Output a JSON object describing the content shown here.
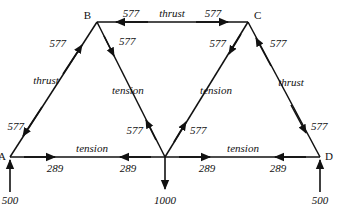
{
  "diagram": {
    "type": "truss-force-diagram",
    "title": "",
    "stroke_color": "#111111",
    "background_color": "#ffffff",
    "nodes": [
      {
        "id": "A",
        "label": "A",
        "x": 10,
        "y": 157
      },
      {
        "id": "B",
        "label": "B",
        "x": 97,
        "y": 22
      },
      {
        "id": "E",
        "label": "",
        "x": 165,
        "y": 157
      },
      {
        "id": "C",
        "label": "C",
        "x": 248,
        "y": 22
      },
      {
        "id": "D",
        "label": "D",
        "x": 320,
        "y": 157
      }
    ],
    "members": [
      {
        "name": "member-B-C-top-chord",
        "from": "B",
        "to": "C",
        "force_type": "thrust",
        "magnitude": "577",
        "end_values": [
          "577",
          "577"
        ]
      },
      {
        "name": "member-A-B-left-rafter",
        "from": "A",
        "to": "B",
        "force_type": "thrust",
        "magnitude": "577",
        "end_values": [
          "577",
          "577"
        ]
      },
      {
        "name": "member-B-E-left-inner-diagonal",
        "from": "B",
        "to": "E",
        "force_type": "tension",
        "magnitude": "577",
        "end_values": [
          "577",
          "577"
        ]
      },
      {
        "name": "member-C-E-right-inner-diagonal",
        "from": "C",
        "to": "E",
        "force_type": "tension",
        "magnitude": "577",
        "end_values": [
          "577",
          "577"
        ]
      },
      {
        "name": "member-C-D-right-rafter",
        "from": "C",
        "to": "D",
        "force_type": "thrust",
        "magnitude": "577",
        "end_values": [
          "577",
          "577"
        ]
      },
      {
        "name": "member-A-E-bottom-left-chord",
        "from": "A",
        "to": "E",
        "force_type": "tension",
        "magnitude": "289",
        "end_values": [
          "289",
          "289"
        ]
      },
      {
        "name": "member-E-D-bottom-right-chord",
        "from": "E",
        "to": "D",
        "force_type": "tension",
        "magnitude": "289",
        "end_values": [
          "289",
          "289"
        ]
      }
    ],
    "labels": {
      "thrust": "thrust",
      "tension": "tension",
      "force_577": "577",
      "force_289": "289",
      "load_1000": "1000",
      "reaction_500": "500"
    },
    "external_forces": [
      {
        "name": "reaction-at-A",
        "value": "500",
        "direction": "up",
        "at_node": "A"
      },
      {
        "name": "applied-load-at-E",
        "value": "1000",
        "direction": "down",
        "at_node": "E"
      },
      {
        "name": "reaction-at-D",
        "value": "500",
        "direction": "up",
        "at_node": "D"
      }
    ],
    "member_force_labels": {
      "bc_left_value": "577",
      "bc_center_type": "thrust",
      "bc_right_value": "577",
      "ab_upper_value": "577",
      "ab_center_type": "thrust",
      "ab_lower_value": "577",
      "be_upper_value": "577",
      "be_center_type": "tension",
      "be_lower_value": "577",
      "ce_upper_value": "577",
      "ce_center_type": "tension",
      "ce_lower_value": "577",
      "cd_upper_value": "577",
      "cd_center_type": "thrust",
      "cd_lower_value": "577",
      "ae_left_value": "289",
      "ae_center_type": "tension",
      "ae_right_value": "289",
      "ed_left_value": "289",
      "ed_center_type": "tension",
      "ed_right_value": "289"
    }
  }
}
